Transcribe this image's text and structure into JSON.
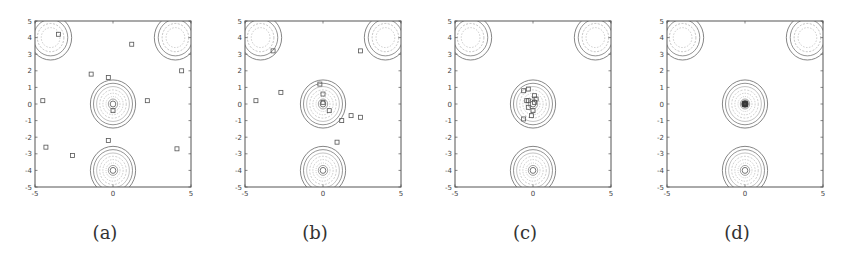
{
  "chart_data": [
    {
      "type": "scatter",
      "panel_label": "(a)",
      "title": "",
      "xlabel": "",
      "ylabel": "",
      "xlim": [
        -5,
        5
      ],
      "ylim": [
        -5,
        5
      ],
      "xticks": [
        -5,
        0,
        5
      ],
      "yticks": [
        5,
        4,
        3,
        2,
        1,
        0,
        -1,
        -2,
        -3,
        -4,
        -5
      ],
      "grid": false,
      "wells": [
        {
          "cx": -4,
          "cy": 4,
          "kind": "shallow"
        },
        {
          "cx": 4,
          "cy": 4,
          "kind": "shallow"
        },
        {
          "cx": 0,
          "cy": 0,
          "kind": "deep"
        },
        {
          "cx": 0,
          "cy": -4,
          "kind": "deep"
        }
      ],
      "series": [
        {
          "name": "particles",
          "marker": "square",
          "points": [
            [
              -3.5,
              4.2
            ],
            [
              1.2,
              3.6
            ],
            [
              -1.4,
              1.8
            ],
            [
              -0.3,
              1.6
            ],
            [
              -4.5,
              0.2
            ],
            [
              2.2,
              0.2
            ],
            [
              0,
              -0.4
            ],
            [
              -0.3,
              -2.2
            ],
            [
              -4.3,
              -2.6
            ],
            [
              -2.6,
              -3.1
            ],
            [
              4.1,
              -2.7
            ],
            [
              4.4,
              2.0
            ]
          ]
        }
      ]
    },
    {
      "type": "scatter",
      "panel_label": "(b)",
      "title": "",
      "xlabel": "",
      "ylabel": "",
      "xlim": [
        -5,
        5
      ],
      "ylim": [
        -5,
        5
      ],
      "xticks": [
        -5,
        0,
        5
      ],
      "yticks": [
        5,
        4,
        3,
        2,
        1,
        0,
        -1,
        -2,
        -3,
        -4,
        -5
      ],
      "grid": false,
      "wells": [
        {
          "cx": -4,
          "cy": 4,
          "kind": "shallow"
        },
        {
          "cx": 4,
          "cy": 4,
          "kind": "shallow"
        },
        {
          "cx": 0,
          "cy": 0,
          "kind": "deep"
        },
        {
          "cx": 0,
          "cy": -4,
          "kind": "deep"
        }
      ],
      "series": [
        {
          "name": "particles",
          "marker": "square",
          "points": [
            [
              -3.2,
              3.2
            ],
            [
              2.4,
              3.2
            ],
            [
              -0.2,
              1.2
            ],
            [
              -2.7,
              0.7
            ],
            [
              0,
              0.6
            ],
            [
              -4.3,
              0.2
            ],
            [
              0,
              0.1
            ],
            [
              0.4,
              -0.4
            ],
            [
              2.4,
              -0.8
            ],
            [
              1.8,
              -0.7
            ],
            [
              1.2,
              -1.0
            ],
            [
              0.9,
              -2.3
            ]
          ]
        }
      ]
    },
    {
      "type": "scatter",
      "panel_label": "(c)",
      "title": "",
      "xlabel": "",
      "ylabel": "",
      "xlim": [
        -5,
        5
      ],
      "ylim": [
        -5,
        5
      ],
      "xticks": [
        -5,
        0,
        5
      ],
      "yticks": [
        5,
        4,
        3,
        2,
        1,
        0,
        -1,
        -2,
        -3,
        -4,
        -5
      ],
      "grid": false,
      "wells": [
        {
          "cx": -4,
          "cy": 4,
          "kind": "shallow"
        },
        {
          "cx": 4,
          "cy": 4,
          "kind": "shallow"
        },
        {
          "cx": 0,
          "cy": 0,
          "kind": "deep"
        },
        {
          "cx": 0,
          "cy": -4,
          "kind": "deep"
        }
      ],
      "series": [
        {
          "name": "particles",
          "marker": "square",
          "points": [
            [
              -0.6,
              0.8
            ],
            [
              -0.3,
              0.9
            ],
            [
              0.1,
              0.5
            ],
            [
              0.2,
              0.3
            ],
            [
              -0.3,
              0.2
            ],
            [
              -0.4,
              0.2
            ],
            [
              0.1,
              0.1
            ],
            [
              -0.3,
              -0.2
            ],
            [
              0,
              -0.4
            ],
            [
              -0.1,
              -0.7
            ],
            [
              -0.6,
              -0.9
            ]
          ]
        }
      ]
    },
    {
      "type": "scatter",
      "panel_label": "(d)",
      "title": "",
      "xlabel": "",
      "ylabel": "",
      "xlim": [
        -5,
        5
      ],
      "ylim": [
        -5,
        5
      ],
      "xticks": [
        -5,
        0,
        5
      ],
      "yticks": [
        5,
        4,
        3,
        2,
        1,
        0,
        -1,
        -2,
        -3,
        -4,
        -5
      ],
      "grid": false,
      "wells": [
        {
          "cx": -4,
          "cy": 4,
          "kind": "shallow"
        },
        {
          "cx": 4,
          "cy": 4,
          "kind": "shallow"
        },
        {
          "cx": 0,
          "cy": 0,
          "kind": "deep"
        },
        {
          "cx": 0,
          "cy": -4,
          "kind": "deep"
        }
      ],
      "series": [
        {
          "name": "particles",
          "marker": "square",
          "points": [
            [
              0,
              0
            ],
            [
              0.05,
              0.05
            ],
            [
              -0.05,
              0.02
            ],
            [
              0.02,
              -0.05
            ],
            [
              -0.03,
              -0.03
            ],
            [
              0.04,
              -0.02
            ],
            [
              -0.02,
              0.05
            ],
            [
              0,
              0.03
            ],
            [
              0.03,
              0
            ],
            [
              -0.04,
              0
            ],
            [
              0,
              -0.02
            ],
            [
              0.01,
              0.01
            ]
          ]
        }
      ]
    }
  ],
  "panels": [
    {
      "label": "(a)",
      "left": 0
    },
    {
      "label": "(b)",
      "left": 210
    },
    {
      "label": "(c)",
      "left": 420
    },
    {
      "label": "(d)",
      "left": 632
    }
  ],
  "colors": {
    "axes": "#555555",
    "contour": "#666666",
    "contour_light": "#9a9a9a",
    "marker": "#555555",
    "tick_text": "#444444",
    "caption": "#333333"
  }
}
